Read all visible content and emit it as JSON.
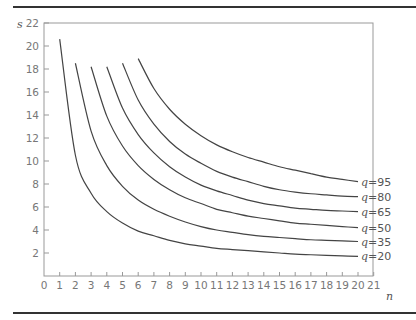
{
  "chart_data": {
    "type": "line",
    "title": "",
    "xlabel": "n",
    "ylabel": "s",
    "xlim": [
      0,
      21
    ],
    "ylim": [
      0,
      22
    ],
    "x_ticks": [
      0,
      1,
      2,
      3,
      4,
      5,
      6,
      7,
      8,
      9,
      10,
      11,
      12,
      13,
      14,
      15,
      16,
      17,
      18,
      19,
      20,
      21
    ],
    "y_ticks": [
      2,
      4,
      6,
      8,
      10,
      12,
      14,
      16,
      18,
      20,
      22
    ],
    "grid": false,
    "legend_position": "inline-right",
    "series": [
      {
        "name": "q=20",
        "x": [
          1,
          2,
          3,
          4,
          5,
          6,
          7,
          8,
          9,
          10,
          11,
          12,
          13,
          14,
          15,
          16,
          17,
          18,
          19,
          20
        ],
        "values": [
          20.6,
          10.5,
          7.2,
          5.6,
          4.6,
          3.9,
          3.5,
          3.1,
          2.8,
          2.6,
          2.4,
          2.3,
          2.2,
          2.1,
          2.0,
          1.9,
          1.85,
          1.8,
          1.75,
          1.7
        ]
      },
      {
        "name": "q=35",
        "x": [
          2,
          3,
          4,
          5,
          6,
          7,
          8,
          9,
          10,
          11,
          12,
          13,
          14,
          15,
          16,
          17,
          18,
          19,
          20
        ],
        "values": [
          18.5,
          12.6,
          9.6,
          7.8,
          6.6,
          5.8,
          5.2,
          4.7,
          4.3,
          4.0,
          3.8,
          3.6,
          3.45,
          3.35,
          3.25,
          3.15,
          3.1,
          3.05,
          3.0
        ]
      },
      {
        "name": "q=50",
        "x": [
          3,
          4,
          5,
          6,
          7,
          8,
          9,
          10,
          11,
          12,
          13,
          14,
          15,
          16,
          17,
          18,
          19,
          20
        ],
        "values": [
          18.2,
          13.9,
          11.3,
          9.6,
          8.4,
          7.5,
          6.8,
          6.3,
          5.8,
          5.5,
          5.2,
          5.0,
          4.8,
          4.6,
          4.5,
          4.4,
          4.3,
          4.2
        ]
      },
      {
        "name": "q=65",
        "x": [
          4,
          5,
          6,
          7,
          8,
          9,
          10,
          11,
          12,
          13,
          14,
          15,
          16,
          17,
          18,
          19,
          20
        ],
        "values": [
          18.2,
          14.6,
          12.3,
          10.7,
          9.5,
          8.6,
          7.9,
          7.4,
          7.0,
          6.6,
          6.3,
          6.1,
          5.9,
          5.8,
          5.7,
          5.65,
          5.6
        ]
      },
      {
        "name": "q=80",
        "x": [
          5,
          6,
          7,
          8,
          9,
          10,
          11,
          12,
          13,
          14,
          15,
          16,
          17,
          18,
          19,
          20
        ],
        "values": [
          18.5,
          15.3,
          13.2,
          11.7,
          10.6,
          9.8,
          9.1,
          8.6,
          8.2,
          7.8,
          7.5,
          7.3,
          7.15,
          7.05,
          6.95,
          6.9
        ]
      },
      {
        "name": "q=95",
        "x": [
          6,
          7,
          8,
          9,
          10,
          11,
          12,
          13,
          14,
          15,
          16,
          17,
          18,
          19,
          20
        ],
        "values": [
          18.9,
          16.3,
          14.5,
          13.2,
          12.2,
          11.4,
          10.8,
          10.3,
          9.9,
          9.5,
          9.2,
          8.9,
          8.6,
          8.4,
          8.2
        ]
      }
    ]
  }
}
